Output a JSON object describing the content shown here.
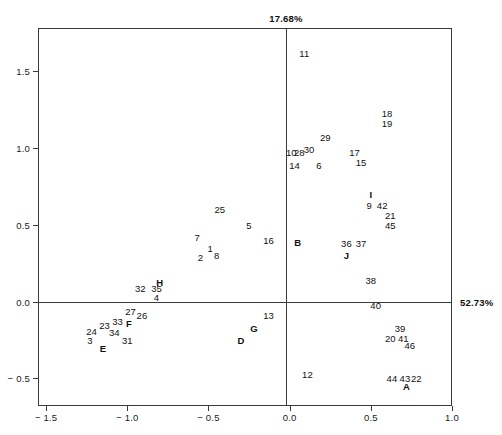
{
  "axes": {
    "top_label": "17.68%",
    "right_label": "52.73%",
    "x_ticks": [
      "-1.5",
      "-1.0",
      "-0.5",
      "0.0",
      "0.5",
      "1.0"
    ],
    "x_tick_values": [
      -1.5,
      -1.0,
      -0.5,
      0.0,
      0.5,
      1.0
    ],
    "y_ticks": [
      "1.5",
      "1.0",
      "0.5",
      "0.0",
      "-0.5"
    ],
    "y_tick_values": [
      1.5,
      1.0,
      0.5,
      0.0,
      -0.5
    ]
  },
  "chart_data": {
    "type": "scatter",
    "title": "",
    "subtitle": "",
    "xlabel": "52.73%",
    "ylabel": "17.68%",
    "xlim": [
      -1.55,
      1.0
    ],
    "ylim": [
      -0.68,
      1.78
    ],
    "grid": false,
    "legend": "none",
    "annotations": [
      "Axis percentages label the explained variance of each principal axis.",
      "Numeric labels are individual observations; bold capital letters are group centroids."
    ],
    "points": [
      {
        "label": "11",
        "x": 0.09,
        "y": 1.62,
        "kind": "observation"
      },
      {
        "label": "18",
        "x": 0.6,
        "y": 1.23,
        "kind": "observation"
      },
      {
        "label": "19",
        "x": 0.6,
        "y": 1.16,
        "kind": "observation"
      },
      {
        "label": "29",
        "x": 0.22,
        "y": 1.07,
        "kind": "observation"
      },
      {
        "label": "10",
        "x": 0.01,
        "y": 0.97,
        "kind": "observation"
      },
      {
        "label": "28",
        "x": 0.06,
        "y": 0.97,
        "kind": "observation"
      },
      {
        "label": "30",
        "x": 0.12,
        "y": 0.99,
        "kind": "observation"
      },
      {
        "label": "17",
        "x": 0.4,
        "y": 0.97,
        "kind": "observation"
      },
      {
        "label": "15",
        "x": 0.44,
        "y": 0.91,
        "kind": "observation"
      },
      {
        "label": "14",
        "x": 0.03,
        "y": 0.89,
        "kind": "observation"
      },
      {
        "label": "6",
        "x": 0.18,
        "y": 0.89,
        "kind": "observation"
      },
      {
        "label": "I",
        "x": 0.5,
        "y": 0.7,
        "kind": "group"
      },
      {
        "label": "9",
        "x": 0.49,
        "y": 0.63,
        "kind": "observation"
      },
      {
        "label": "42",
        "x": 0.57,
        "y": 0.63,
        "kind": "observation"
      },
      {
        "label": "21",
        "x": 0.62,
        "y": 0.56,
        "kind": "observation"
      },
      {
        "label": "25",
        "x": -0.43,
        "y": 0.6,
        "kind": "observation"
      },
      {
        "label": "45",
        "x": 0.62,
        "y": 0.5,
        "kind": "observation"
      },
      {
        "label": "5",
        "x": -0.25,
        "y": 0.5,
        "kind": "observation"
      },
      {
        "label": "7",
        "x": -0.57,
        "y": 0.42,
        "kind": "observation"
      },
      {
        "label": "16",
        "x": -0.13,
        "y": 0.4,
        "kind": "observation"
      },
      {
        "label": "B",
        "x": 0.05,
        "y": 0.39,
        "kind": "group"
      },
      {
        "label": "36",
        "x": 0.35,
        "y": 0.38,
        "kind": "observation"
      },
      {
        "label": "37",
        "x": 0.44,
        "y": 0.38,
        "kind": "observation"
      },
      {
        "label": "1",
        "x": -0.49,
        "y": 0.35,
        "kind": "observation"
      },
      {
        "label": "8",
        "x": -0.45,
        "y": 0.3,
        "kind": "observation"
      },
      {
        "label": "2",
        "x": -0.55,
        "y": 0.29,
        "kind": "observation"
      },
      {
        "label": "J",
        "x": 0.35,
        "y": 0.3,
        "kind": "group"
      },
      {
        "label": "H",
        "x": -0.8,
        "y": 0.13,
        "kind": "group"
      },
      {
        "label": "32",
        "x": -0.92,
        "y": 0.09,
        "kind": "observation"
      },
      {
        "label": "35",
        "x": -0.82,
        "y": 0.09,
        "kind": "observation"
      },
      {
        "label": "38",
        "x": 0.5,
        "y": 0.14,
        "kind": "observation"
      },
      {
        "label": "4",
        "x": -0.82,
        "y": 0.03,
        "kind": "observation"
      },
      {
        "label": "40",
        "x": 0.53,
        "y": -0.02,
        "kind": "observation"
      },
      {
        "label": "27",
        "x": -0.98,
        "y": -0.06,
        "kind": "observation"
      },
      {
        "label": "26",
        "x": -0.91,
        "y": -0.09,
        "kind": "observation"
      },
      {
        "label": "13",
        "x": -0.13,
        "y": -0.09,
        "kind": "observation"
      },
      {
        "label": "33",
        "x": -1.06,
        "y": -0.13,
        "kind": "observation"
      },
      {
        "label": "F",
        "x": -0.99,
        "y": -0.14,
        "kind": "group"
      },
      {
        "label": "23",
        "x": -1.14,
        "y": -0.15,
        "kind": "observation"
      },
      {
        "label": "39",
        "x": 0.68,
        "y": -0.17,
        "kind": "observation"
      },
      {
        "label": "24",
        "x": -1.22,
        "y": -0.19,
        "kind": "observation"
      },
      {
        "label": "34",
        "x": -1.08,
        "y": -0.2,
        "kind": "observation"
      },
      {
        "label": "G",
        "x": -0.22,
        "y": -0.17,
        "kind": "group"
      },
      {
        "label": "20",
        "x": 0.62,
        "y": -0.24,
        "kind": "observation"
      },
      {
        "label": "41",
        "x": 0.7,
        "y": -0.24,
        "kind": "observation"
      },
      {
        "label": "3",
        "x": -1.23,
        "y": -0.25,
        "kind": "observation"
      },
      {
        "label": "31",
        "x": -1.0,
        "y": -0.25,
        "kind": "observation"
      },
      {
        "label": "D",
        "x": -0.3,
        "y": -0.25,
        "kind": "group"
      },
      {
        "label": "46",
        "x": 0.74,
        "y": -0.28,
        "kind": "observation"
      },
      {
        "label": "E",
        "x": -1.15,
        "y": -0.3,
        "kind": "group"
      },
      {
        "label": "12",
        "x": 0.11,
        "y": -0.47,
        "kind": "observation"
      },
      {
        "label": "44",
        "x": 0.63,
        "y": -0.5,
        "kind": "observation"
      },
      {
        "label": "43",
        "x": 0.71,
        "y": -0.5,
        "kind": "observation"
      },
      {
        "label": "22",
        "x": 0.78,
        "y": -0.5,
        "kind": "observation"
      },
      {
        "label": "A",
        "x": 0.72,
        "y": -0.55,
        "kind": "group"
      }
    ]
  }
}
